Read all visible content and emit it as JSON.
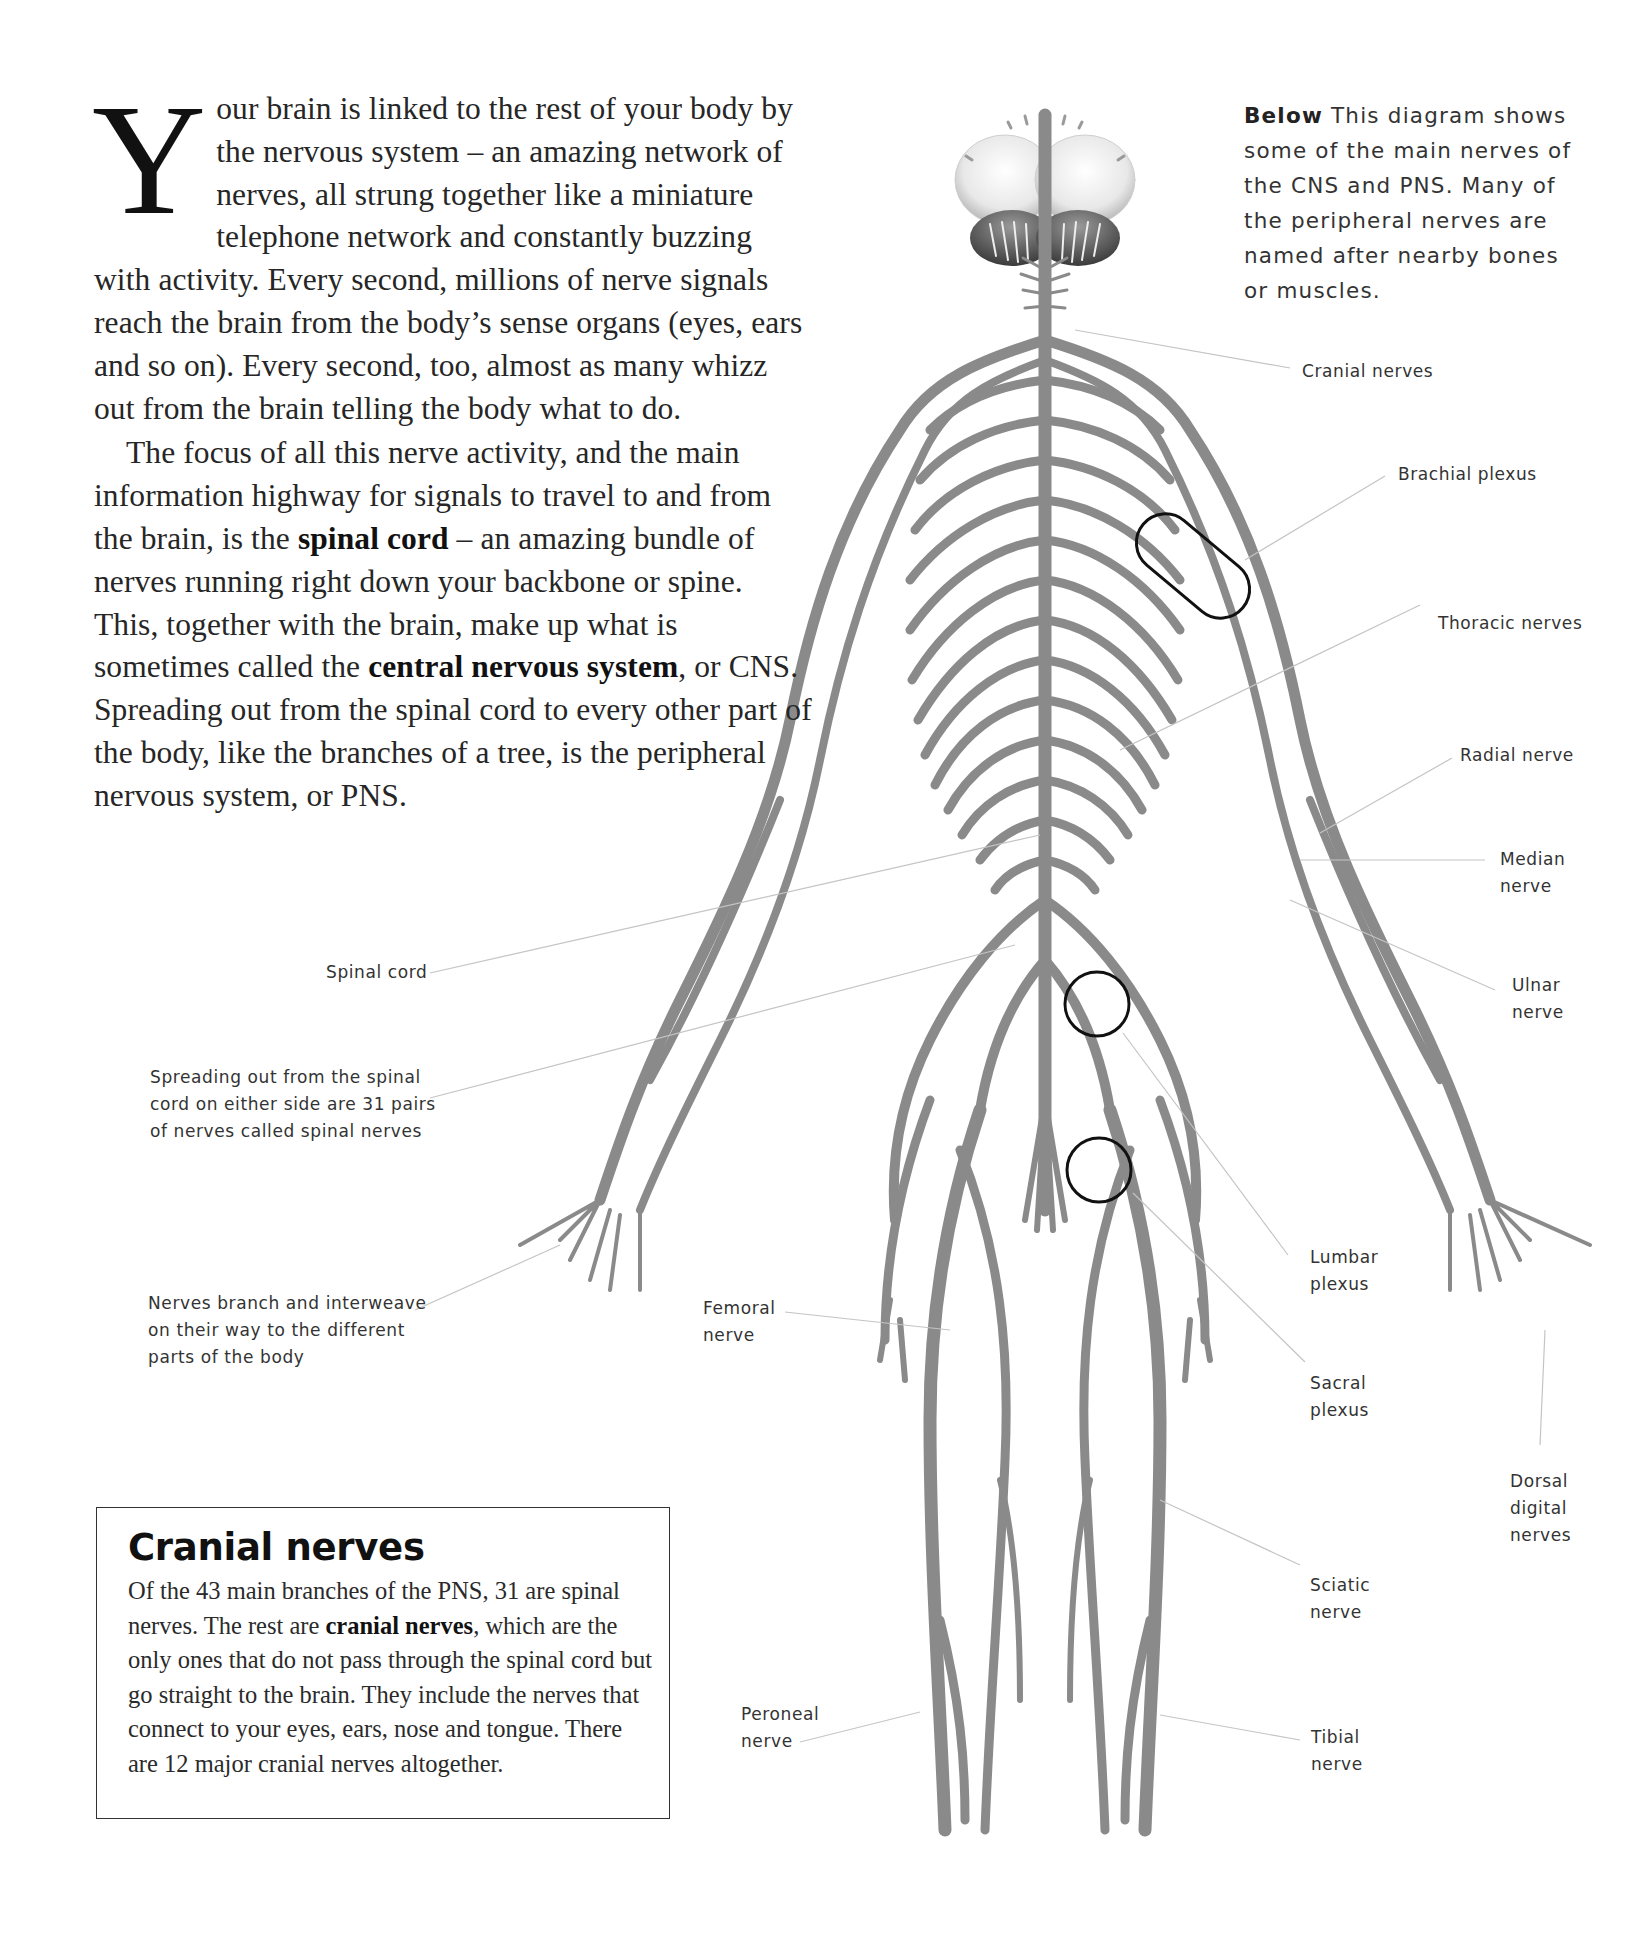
{
  "intro": {
    "drop_cap": "Y",
    "paragraph1_rest": "our brain is linked to the rest of your body by the nervous system – an amazing network of nerves, all strung together like a miniature telephone network and constantly buzzing with activity. Every second, millions of nerve signals reach the brain from the body’s sense organs (eyes, ears and so on). Every second, too, almost as many whizz out from the brain telling the body what to do.",
    "paragraph2": {
      "part1": "The focus of all this nerve activity, and the main information highway for signals to travel to and from the brain, is the ",
      "bold1": "spinal cord",
      "part2": " – an amazing bundle of nerves running right down your backbone or spine. This, together with the brain, make up what is sometimes called the ",
      "bold2": "central nervous system",
      "part3": ", or CNS. Spreading out from the spinal cord to every other part of the body, like the branches of a tree, is the peripheral nervous system, or PNS."
    }
  },
  "caption": {
    "lead": "Below",
    "text": " This diagram shows some of the main nerves of the CNS and PNS. Many of the peripheral nerves are named after nearby bones or muscles."
  },
  "figure": {
    "labels": {
      "cranial_nerves": "Cranial nerves",
      "brachial_plexus": "Brachial plexus",
      "thoracic_nerves": "Thoracic nerves",
      "radial_nerve": "Radial nerve",
      "median_nerve": "Median\nnerve",
      "ulnar_nerve": "Ulnar\nnerve",
      "spinal_cord": "Spinal cord",
      "spinal_nerves_note": "Spreading out from the spinal\ncord on either side are 31 pairs\nof nerves called spinal nerves",
      "branch_note": "Nerves branch and interweave\non their way to the different\nparts of the body",
      "femoral_nerve": "Femoral\nnerve",
      "lumbar_plexus": "Lumbar\nplexus",
      "sacral_plexus": "Sacral\nplexus",
      "dorsal_digital_nerves": "Dorsal\ndigital\nnerves",
      "sciatic_nerve": "Sciatic\nnerve",
      "peroneal_nerve": "Peroneal\nnerve",
      "tibial_nerve": "Tibial\nnerve"
    },
    "colors": {
      "nerve": "#8a8a8a",
      "leader_line": "#c4c4c4",
      "highlight_ring": "#111111"
    }
  },
  "sidebar_box": {
    "title": "Cranial nerves",
    "body_part1": "Of the 43 main branches of the PNS, 31 are spinal nerves. The rest are ",
    "body_bold": "cranial nerves",
    "body_part2": ", which are the only ones that do not pass through the spinal cord but go straight to the brain. They include the nerves that connect to your eyes, ears, nose and tongue. There are 12 major cranial nerves altogether."
  }
}
